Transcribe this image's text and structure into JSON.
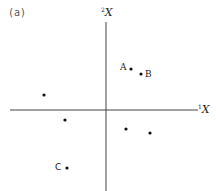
{
  "figure": {
    "panel_label": "(a)",
    "axes": {
      "x_axis": {
        "superscript": "1",
        "name": "X",
        "y": 110,
        "x_start": 10,
        "x_end": 198
      },
      "y_axis": {
        "superscript": "2",
        "name": "X",
        "x": 106,
        "y_start": 22,
        "y_end": 191
      }
    },
    "colors": {
      "axis": "#444444",
      "point": "#111111",
      "text": "#222222"
    },
    "points": [
      {
        "id": "A",
        "label": "A",
        "cx": 131,
        "cy": 69,
        "label_x": 120,
        "label_y": 63
      },
      {
        "id": "B",
        "label": "B",
        "cx": 141,
        "cy": 74,
        "label_x": 145,
        "label_y": 70
      },
      {
        "id": "p3",
        "label": "",
        "cx": 44,
        "cy": 95
      },
      {
        "id": "p4",
        "label": "",
        "cx": 65,
        "cy": 120
      },
      {
        "id": "p5",
        "label": "",
        "cx": 126,
        "cy": 129
      },
      {
        "id": "p6",
        "label": "",
        "cx": 150,
        "cy": 133
      },
      {
        "id": "C",
        "label": "C",
        "cx": 67,
        "cy": 168,
        "label_x": 55,
        "label_y": 163
      }
    ]
  }
}
